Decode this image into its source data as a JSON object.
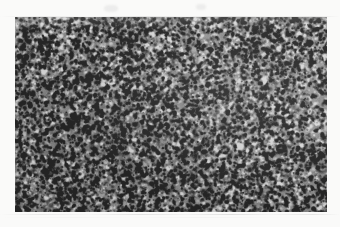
{
  "figure": {
    "kind": "photomicrograph",
    "caption": "",
    "scale_bar_label": "",
    "annotation": "",
    "canvas": {
      "width": 340,
      "height": 227
    },
    "background_color": "#fafaf9",
    "margin_artifact_color": "#9a9a9a"
  },
  "panel": {
    "name": "histology-micrograph",
    "x": 15,
    "y": 17,
    "width": 312,
    "height": 195,
    "border_color": "#8a8a8a",
    "base_color": "#8a8a8a",
    "dark_nuclei_color": "#2b2b2b",
    "light_matrix_color": "#c9c9c9",
    "mean_gray": 138,
    "contrast_range": [
      38,
      214
    ],
    "stain": "grayscale",
    "texture": {
      "description": "dense uniform small-round-cell texture; numerous small dark nuclei over a mid-gray matrix",
      "nucleus_min_px": 1,
      "nucleus_max_px": 3,
      "nucleus_count": 9000,
      "clump_count": 420,
      "grain_amount": 0.42,
      "seed": 20240917
    },
    "features": [
      {
        "name": "bright-focus-blob",
        "description": "small bright rounded pale area",
        "cx_frac": 0.722,
        "cy_frac": 0.662,
        "radius_px": 4.5,
        "brightness": 226
      },
      {
        "name": "pale-smooth-region-upper-right",
        "description": "slightly lighter, smoother zone toward the upper right",
        "cx_frac": 0.8,
        "cy_frac": 0.3,
        "radius_frac": 0.3,
        "brightness_delta": 16
      },
      {
        "name": "pale-streak-right-edge",
        "description": "faint light diagonal streak near right edge",
        "cx_frac": 0.955,
        "cy_frac": 0.215,
        "radius_frac": 0.09,
        "brightness_delta": 22
      },
      {
        "name": "darker-zone-lower-left",
        "description": "marginally darker, denser region in the lower left",
        "cx_frac": 0.22,
        "cy_frac": 0.74,
        "radius_frac": 0.3,
        "brightness_delta": -10
      }
    ]
  },
  "margin_artifacts": [
    {
      "name": "scan-streak-top",
      "y": 16,
      "opacity": 0.8,
      "faint": false
    },
    {
      "name": "scan-streak-bottom",
      "y": 214,
      "opacity": 0.8,
      "faint": false
    },
    {
      "name": "scan-streak-bottom-2",
      "y": 216,
      "opacity": 0.3,
      "faint": true
    },
    {
      "name": "margin-smudge-top",
      "x": 104,
      "y": 5,
      "width": 14,
      "height": 7
    },
    {
      "name": "margin-smudge-top-right",
      "x": 196,
      "y": 4,
      "width": 10,
      "height": 6
    }
  ]
}
